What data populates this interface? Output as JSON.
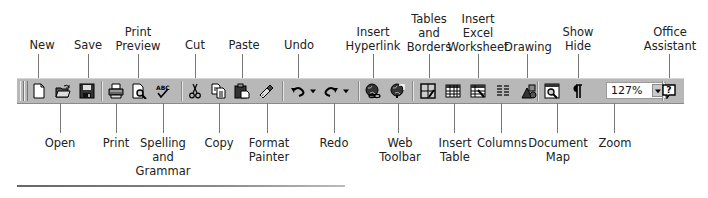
{
  "toolbar": {
    "name": "Standard Toolbar",
    "background": "#b8b8b8",
    "zoom_value": "127%",
    "buttons": [
      {
        "id": "new",
        "icon": "new-document-icon"
      },
      {
        "id": "open",
        "icon": "open-folder-icon"
      },
      {
        "id": "save",
        "icon": "floppy-disk-icon"
      },
      {
        "id": "print",
        "icon": "printer-icon"
      },
      {
        "id": "print-preview",
        "icon": "print-preview-icon"
      },
      {
        "id": "spelling",
        "icon": "spelling-check-icon"
      },
      {
        "id": "cut",
        "icon": "scissors-icon"
      },
      {
        "id": "copy",
        "icon": "copy-icon"
      },
      {
        "id": "paste",
        "icon": "clipboard-paste-icon"
      },
      {
        "id": "format-painter",
        "icon": "paintbrush-icon"
      },
      {
        "id": "undo",
        "icon": "undo-arrow-icon"
      },
      {
        "id": "redo",
        "icon": "redo-arrow-icon"
      },
      {
        "id": "insert-hyperlink",
        "icon": "globe-link-icon"
      },
      {
        "id": "web-toolbar",
        "icon": "globe-arrow-icon"
      },
      {
        "id": "tables-borders",
        "icon": "table-pencil-icon"
      },
      {
        "id": "insert-table",
        "icon": "table-grid-icon"
      },
      {
        "id": "insert-excel",
        "icon": "worksheet-icon"
      },
      {
        "id": "columns",
        "icon": "columns-icon"
      },
      {
        "id": "drawing",
        "icon": "drawing-shapes-icon"
      },
      {
        "id": "document-map",
        "icon": "document-map-icon"
      },
      {
        "id": "show-hide",
        "icon": "pilcrow-icon"
      },
      {
        "id": "office-assistant",
        "icon": "help-balloon-icon"
      }
    ]
  },
  "labels_top": {
    "new": "New",
    "save": "Save",
    "print_preview": [
      "Print",
      "Preview"
    ],
    "cut": "Cut",
    "paste": "Paste",
    "undo": "Undo",
    "insert_hyperlink": [
      "Insert",
      "Hyperlink"
    ],
    "tables_borders": [
      "Tables",
      "and",
      "Borders"
    ],
    "insert_excel": [
      "Insert",
      "Excel",
      "Worksheet"
    ],
    "drawing": "Drawing",
    "show_hide": [
      "Show",
      "Hide"
    ],
    "office_assistant": [
      "Office",
      "Assistant"
    ]
  },
  "labels_bottom": {
    "open": "Open",
    "print": "Print",
    "spelling": [
      "Spelling",
      "and",
      "Grammar"
    ],
    "copy": "Copy",
    "format_painter": [
      "Format",
      "Painter"
    ],
    "redo": "Redo",
    "web_toolbar": [
      "Web",
      "Toolbar"
    ],
    "insert_table": [
      "Insert",
      "Table"
    ],
    "columns": "Columns",
    "document_map": [
      "Document",
      "Map"
    ],
    "zoom": "Zoom"
  }
}
